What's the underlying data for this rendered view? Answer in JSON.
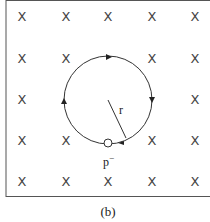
{
  "figure": {
    "caption": "(b)",
    "radius_label": "r",
    "particle_label": "p",
    "particle_charge": "−",
    "field_symbol": "×",
    "field_grid": {
      "rows": 5,
      "cols": 5
    },
    "motion_direction": "clockwise",
    "colors": {
      "line": "#333333",
      "background": "#ffffff",
      "border": "#555555"
    }
  }
}
